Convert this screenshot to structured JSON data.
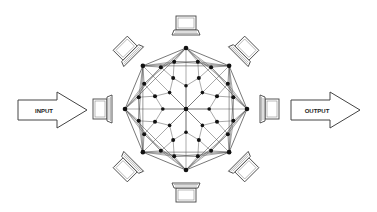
{
  "diagram": {
    "type": "peer-to-peer mesh network",
    "input_arrow": {
      "label": "INPUT"
    },
    "output_arrow": {
      "label": "OUTPUT"
    },
    "center": {
      "x": 186,
      "y": 109
    },
    "outer_radius": 61,
    "laptop_count": 8,
    "laptops": [
      {
        "id": "top",
        "angle": -90
      },
      {
        "id": "top-right",
        "angle": -45
      },
      {
        "id": "right",
        "angle": 0
      },
      {
        "id": "bottom-right",
        "angle": 45
      },
      {
        "id": "bottom",
        "angle": 90
      },
      {
        "id": "bottom-left",
        "angle": 135
      },
      {
        "id": "left",
        "angle": 180
      },
      {
        "id": "top-left",
        "angle": -135
      }
    ],
    "colors": {
      "line": "#555555",
      "node": "#111111",
      "arrow_stroke": "#444444",
      "arrow_fill": "#ffffff",
      "background": "#ffffff"
    }
  }
}
